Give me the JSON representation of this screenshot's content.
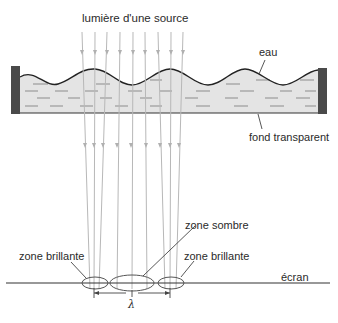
{
  "labels": {
    "source": "lumière d'une source",
    "water": "eau",
    "bottom": "fond transparent",
    "dark_zone": "zone sombre",
    "bright_zone_left": "zone brillante",
    "bright_zone_right": "zone brillante",
    "screen": "écran",
    "wavelength": "λ"
  },
  "colors": {
    "water_fill": "#e4e4e4",
    "wall": "#4a4a4a",
    "wave_line": "#222222",
    "ray": "#b8b8b8",
    "dash": "#8c8c8c",
    "screen_line": "#333333",
    "text": "#2a2a2a"
  },
  "rays": {
    "top_x": [
      82,
      95,
      107,
      120,
      133,
      145,
      158,
      171,
      183
    ],
    "bottom_x": [
      90,
      94,
      99,
      117,
      132,
      147,
      165,
      170,
      176
    ]
  },
  "zones": [
    {
      "name": "zone brillante",
      "cx": 95,
      "cy": 283,
      "rx": 13,
      "ry": 6
    },
    {
      "name": "zone sombre",
      "cx": 132,
      "cy": 283,
      "rx": 22,
      "ry": 8
    },
    {
      "name": "zone brillante",
      "cx": 171,
      "cy": 283,
      "rx": 13,
      "ry": 6
    }
  ]
}
